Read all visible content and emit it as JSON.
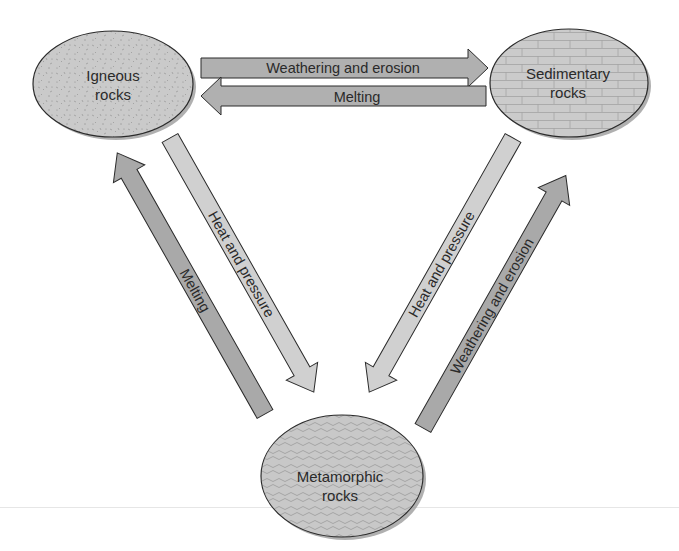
{
  "diagram": {
    "colors": {
      "node_fill": "#c9c9c9",
      "node_stroke": "#2b2b2b",
      "node_shadow": "#8a8a8a",
      "arrow_dark": "#a9a9a9",
      "arrow_light": "#cfcfcf",
      "arrow_stroke": "#2b2b2b",
      "texture": "#9a9a9a"
    },
    "nodes": [
      {
        "id": "igneous",
        "line1": "Igneous",
        "line2": "rocks",
        "texture": "speckled"
      },
      {
        "id": "sedimentary",
        "line1": "Sedimentary",
        "line2": "rocks",
        "texture": "brick"
      },
      {
        "id": "metamorphic",
        "line1": "Metamorphic",
        "line2": "rocks",
        "texture": "wavy-foliation"
      }
    ],
    "edges": [
      {
        "from": "igneous",
        "to": "sedimentary",
        "label": "Weathering and erosion"
      },
      {
        "from": "sedimentary",
        "to": "igneous",
        "label": "Melting"
      },
      {
        "from": "igneous",
        "to": "metamorphic",
        "label": "Heat and pressure"
      },
      {
        "from": "metamorphic",
        "to": "igneous",
        "label": "Melting"
      },
      {
        "from": "sedimentary",
        "to": "metamorphic",
        "label": "Heat and pressure"
      },
      {
        "from": "metamorphic",
        "to": "sedimentary",
        "label": "Weathering and erosion"
      }
    ]
  }
}
